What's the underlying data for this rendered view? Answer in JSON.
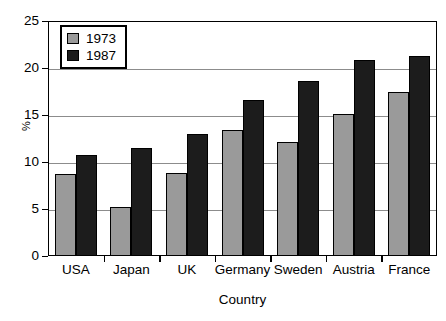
{
  "chart_data": {
    "type": "bar",
    "title": "",
    "xlabel": "Country",
    "ylabel": "%",
    "categories": [
      "USA",
      "Japan",
      "UK",
      "Germany",
      "Sweden",
      "Austria",
      "France"
    ],
    "series": [
      {
        "name": "1973",
        "color": "#9a9a9a",
        "values": [
          8.7,
          5.2,
          8.8,
          13.4,
          12.1,
          15.1,
          17.4
        ]
      },
      {
        "name": "1987",
        "color": "#1c1c1c",
        "values": [
          10.7,
          11.5,
          13.0,
          16.6,
          18.6,
          20.8,
          21.3
        ]
      }
    ],
    "ylim": [
      0,
      25
    ],
    "yticks": [
      0,
      5,
      10,
      15,
      20,
      25
    ],
    "ytick_labels": [
      "0",
      "5",
      "10",
      "15",
      "20",
      "25"
    ],
    "grid": true,
    "gridline_values": [
      5,
      10,
      15,
      20
    ],
    "legend_position": "top-left",
    "axis_color": "#000000",
    "gridline_color": "#8c8c8c",
    "background": "#ffffff"
  }
}
